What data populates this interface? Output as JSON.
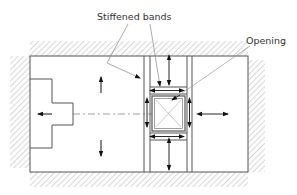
{
  "diagram": {
    "type": "structural-plan",
    "labels": {
      "stiffened_bands": "Stiffened bands",
      "opening": "Opening"
    },
    "elements": [
      "hatched-supports",
      "plate-outline",
      "stepped-shape",
      "centre-line",
      "stiffened-bands",
      "opening",
      "direction-arrows"
    ],
    "colors": {
      "line": "#555555",
      "hatch": "#9a9a9a",
      "arrow": "#111111",
      "leader": "#8a8a8a"
    }
  }
}
